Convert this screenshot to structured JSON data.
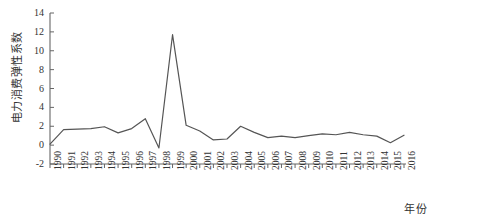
{
  "chart_data": {
    "type": "line",
    "title": "",
    "xlabel": "年份",
    "ylabel": "电力消费弹性系数",
    "categories": [
      "1990",
      "1991",
      "1992",
      "1993",
      "1994",
      "1995",
      "1996",
      "1997",
      "1998",
      "1999",
      "2000",
      "2001",
      "2002",
      "2003",
      "2004",
      "2005",
      "2006",
      "2007",
      "2008",
      "2009",
      "2010",
      "2011",
      "2012",
      "2013",
      "2014",
      "2015",
      "2016"
    ],
    "values": [
      0.1,
      1.65,
      1.7,
      1.75,
      1.95,
      1.3,
      1.75,
      2.8,
      -0.3,
      11.7,
      2.1,
      1.5,
      0.55,
      0.65,
      2.0,
      1.35,
      0.8,
      0.95,
      0.8,
      1.0,
      1.2,
      1.1,
      1.35,
      1.1,
      0.95,
      0.25,
      1.05
    ],
    "yticks": [
      -2,
      0,
      2,
      4,
      6,
      8,
      10,
      12,
      14
    ],
    "ytick_labels": [
      "-2",
      "0",
      "2",
      "4",
      "6",
      "8",
      "10",
      "12",
      "14"
    ],
    "ylim": [
      -2,
      14
    ],
    "grid": false,
    "legend": null,
    "line_color": "#555555",
    "axis_color": "#666666",
    "text_color": "#333333",
    "background_color": "#ffffff"
  }
}
